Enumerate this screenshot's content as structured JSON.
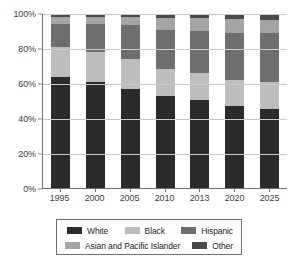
{
  "chart_data": {
    "type": "bar",
    "subtype": "stacked-bar-100-percent",
    "title": "",
    "xlabel": "",
    "ylabel": "",
    "ylim": [
      0,
      100
    ],
    "ytick_labels": [
      "0%",
      "20%",
      "40%",
      "60%",
      "80%",
      "100%"
    ],
    "ytick_values": [
      0,
      20,
      40,
      60,
      80,
      100
    ],
    "grid": true,
    "grid_axis": "y",
    "legend_position": "bottom",
    "categories": [
      "1995",
      "2000",
      "2005",
      "2010",
      "2013",
      "2020",
      "2025"
    ],
    "stack_order_bottom_to_top": [
      "White",
      "Black",
      "Hispanic",
      "Asian and Pacific Islander",
      "Other"
    ],
    "series": [
      {
        "name": "White",
        "color": "#2b2b2b",
        "values": [
          64.0,
          61.0,
          57.0,
          53.0,
          50.5,
          47.0,
          45.5
        ]
      },
      {
        "name": "Black",
        "color": "#bdbdbd",
        "values": [
          17.0,
          17.0,
          17.0,
          15.5,
          15.5,
          15.0,
          15.5
        ]
      },
      {
        "name": "Hispanic",
        "color": "#6e6e6e",
        "values": [
          13.0,
          16.0,
          19.5,
          22.5,
          24.5,
          27.0,
          28.0
        ]
      },
      {
        "name": "Asian and Pacific Islander",
        "color": "#a5a5a5",
        "values": [
          4.5,
          4.5,
          4.5,
          6.5,
          7.0,
          8.0,
          7.5
        ]
      },
      {
        "name": "Other",
        "color": "#4a4a4a",
        "values": [
          1.5,
          1.5,
          2.0,
          2.5,
          2.5,
          3.0,
          3.5
        ]
      }
    ]
  },
  "legend": {
    "items": [
      {
        "label": "White",
        "swatch": "white-swatch"
      },
      {
        "label": "Black",
        "swatch": "black-swatch"
      },
      {
        "label": "Hispanic",
        "swatch": "hispanic-swatch"
      },
      {
        "label": "Asian and Pacific Islander",
        "swatch": "asian-pacific-islander-swatch"
      },
      {
        "label": "Other",
        "swatch": "other-swatch"
      }
    ]
  },
  "caption": {
    "text": ""
  }
}
